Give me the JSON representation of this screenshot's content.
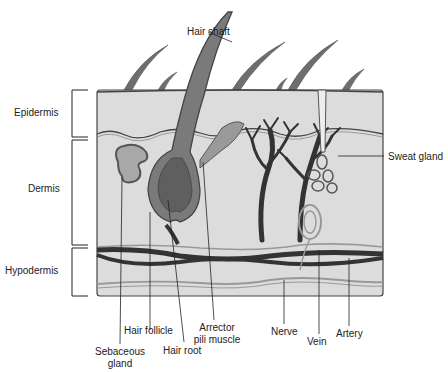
{
  "diagram": {
    "layers": [
      {
        "label": "Epidermis"
      },
      {
        "label": "Dermis"
      },
      {
        "label": "Hypodermis"
      }
    ],
    "labels": {
      "hair_shaft": "Hair shaft",
      "sweat_gland": "Sweat gland",
      "hair_follicle": "Hair follicle",
      "sebaceous_gland_line1": "Sebaceous",
      "sebaceous_gland_line2": "gland",
      "hair_root": "Hair root",
      "arrector_line1": "Arrector",
      "arrector_line2": "pili muscle",
      "nerve": "Nerve",
      "vein": "Vein",
      "artery": "Artery"
    },
    "colors": {
      "skin_fill": "#d9d9d9",
      "outline": "#444444",
      "hair": "#6e6e6e",
      "vessel": "#333333",
      "nerve": "#999999"
    }
  }
}
